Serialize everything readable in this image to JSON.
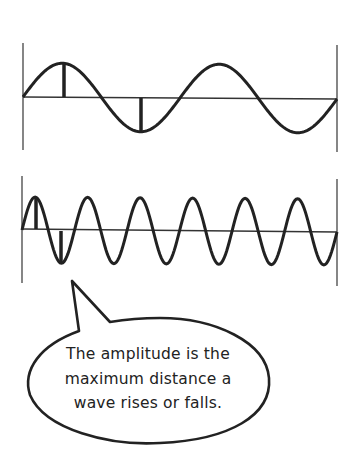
{
  "diagram": {
    "colors": {
      "stroke": "#222222",
      "frame": "#444444",
      "background": "#ffffff"
    },
    "waves": [
      {
        "name": "low-frequency-wave",
        "cycles": 2,
        "baseline_y": 97,
        "amplitude_px": 34,
        "x_start": 23,
        "x_end": 337,
        "frame_top": 43,
        "frame_bottom": 150,
        "amplitude_markers": [
          "crest",
          "trough"
        ]
      },
      {
        "name": "high-frequency-wave",
        "cycles": 6,
        "baseline_y": 230,
        "amplitude_px": 33,
        "x_start": 22,
        "x_end": 337,
        "frame_top": 176,
        "frame_bottom": 283,
        "amplitude_markers": [
          "crest",
          "trough"
        ]
      }
    ],
    "callout": {
      "lines": [
        "The amplitude is the",
        "maximum distance a",
        "wave rises or falls."
      ]
    }
  }
}
